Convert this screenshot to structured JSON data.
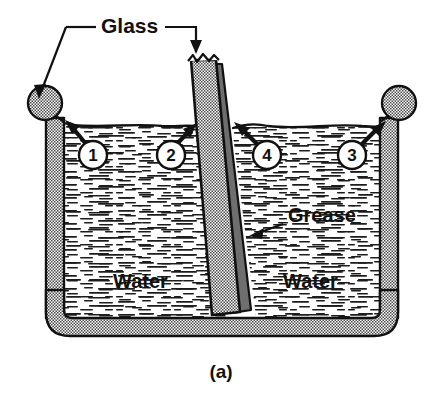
{
  "figure": {
    "caption": "(a)",
    "labels": {
      "glass": "Glass",
      "grease": "Grease",
      "water_left": "Water",
      "water_right": "Water"
    },
    "callouts": [
      {
        "id": "callout-1",
        "number": "1",
        "points_to": "water-meniscus-at-left-container-wall"
      },
      {
        "id": "callout-2",
        "number": "2",
        "points_to": "water-meniscus-at-left-face-of-glass-plate"
      },
      {
        "id": "callout-3",
        "number": "3",
        "points_to": "water-meniscus-at-right-container-wall"
      },
      {
        "id": "callout-4",
        "number": "4",
        "points_to": "water-meniscus-at-greased-right-face-of-glass-plate"
      }
    ],
    "colors": {
      "ink": "#111111",
      "glass_fill": "#9e9e9e",
      "grease_fill": "#6e6e6e",
      "water_fill": "#ffffff",
      "background": "#ffffff"
    },
    "elements": {
      "container": "open-top glass vessel with beaded rim and rounded bottom corners",
      "plate": "tilted flat glass plate partially immersed",
      "grease_layer": "grease coating on right face of glass plate",
      "water_surface": "water free surface with meniscus at each solid boundary"
    }
  }
}
